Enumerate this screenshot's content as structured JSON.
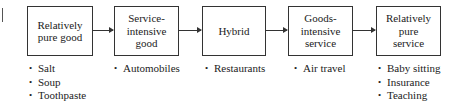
{
  "diagram": {
    "type": "continuum-flow",
    "stages": [
      {
        "label": "Relatively\npure good",
        "examples": [
          "Salt",
          "Soup",
          "Toothpaste"
        ]
      },
      {
        "label": "Service-\nintensive\ngood",
        "examples": [
          "Automobiles"
        ]
      },
      {
        "label": "Hybrid",
        "examples": [
          "Restaurants"
        ]
      },
      {
        "label": "Goods-\nintensive\nservice",
        "examples": [
          "Air travel"
        ]
      },
      {
        "label": "Relatively\npure\nservice",
        "examples": [
          "Baby sitting",
          "Insurance",
          "Teaching"
        ]
      }
    ],
    "connectors": [
      {
        "from": 0,
        "to": 1,
        "icon": "arrow-right-icon"
      },
      {
        "from": 1,
        "to": 2,
        "icon": "arrow-right-icon"
      },
      {
        "from": 2,
        "to": 3,
        "icon": "arrow-right-icon"
      },
      {
        "from": 3,
        "to": 4,
        "icon": "arrow-right-icon"
      }
    ],
    "colors": {
      "stroke": "#333333",
      "text": "#222222",
      "background": "#ffffff"
    }
  }
}
